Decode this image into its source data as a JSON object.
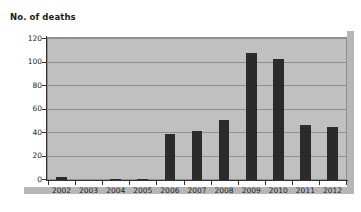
{
  "chart_data": {
    "type": "bar",
    "title": "No. of deaths",
    "xlabel": "",
    "ylabel": "",
    "categories": [
      "2002",
      "2003",
      "2004",
      "2005",
      "2006",
      "2007",
      "2008",
      "2009",
      "2010",
      "2011",
      "2012"
    ],
    "values": [
      3,
      0,
      1,
      1,
      39,
      42,
      51,
      108,
      103,
      47,
      45
    ],
    "ylim": [
      0,
      120
    ],
    "yticks": [
      0,
      20,
      40,
      60,
      80,
      100,
      120
    ],
    "ytick_labels": [
      "0",
      "20",
      "40",
      "60",
      "80",
      "100",
      "120"
    ],
    "grid": true,
    "legend": false,
    "series": [
      {
        "name": "No. of deaths",
        "values": [
          3,
          0,
          1,
          1,
          39,
          42,
          51,
          108,
          103,
          47,
          45
        ]
      }
    ]
  },
  "colors": {
    "bar": "#2b2b2b",
    "plot_background": "#c0c0c0",
    "gridline": "#8f8f8f",
    "axis": "#333333",
    "shadow": "#b7b7b7",
    "page_background": "#ffffff",
    "text": "#1f1f1f"
  }
}
